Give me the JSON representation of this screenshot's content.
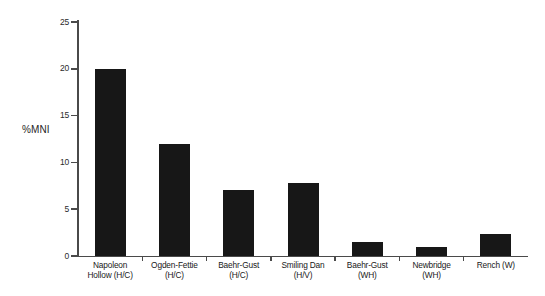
{
  "chart_data": {
    "type": "bar",
    "title": "",
    "subtitle": "",
    "xlabel": "",
    "ylabel": "%MNI",
    "ylim": [
      0,
      25
    ],
    "yticks": [
      0,
      5,
      10,
      15,
      20,
      25
    ],
    "ytick_labels": [
      "0",
      "5",
      "10",
      "15",
      "20",
      "25"
    ],
    "grid": false,
    "legend": null,
    "bar_color": "#171717",
    "axis_color": "#4a4a4a",
    "background_color": "#ffffff",
    "categories": [
      "Napoleon\nHollow (H/C)",
      "Ogden-Fettie\n(H/C)",
      "Baehr-Gust\n(H/C)",
      "Smiling Dan\n(H/V)",
      "Baehr-Gust\n(WH)",
      "Newbridge\n(WH)",
      "Rench (W)"
    ],
    "values": [
      20.0,
      12.0,
      7.0,
      7.8,
      1.5,
      1.0,
      2.4
    ]
  },
  "axis": {
    "y_title": "%MNI",
    "y_tick_labels": [
      "25",
      "20",
      "15",
      "10",
      "5",
      "0"
    ]
  }
}
